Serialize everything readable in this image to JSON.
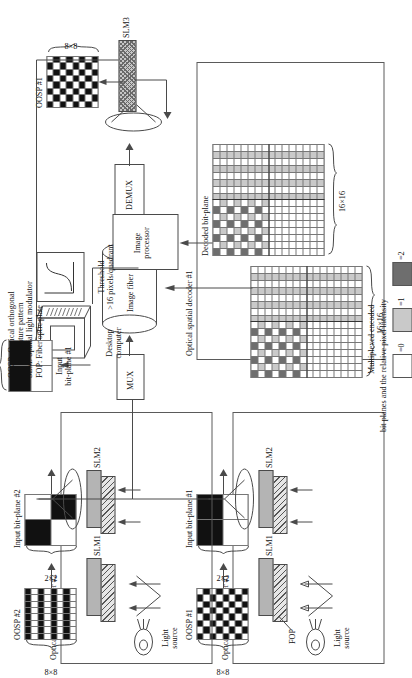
{
  "figure": {
    "orientation": "rotated-90-ccw"
  },
  "legend_intensity": {
    "title_line1": "Multiplexed encoded",
    "title_line2": "bit planes and the relative pixel intensity",
    "items": [
      {
        "label": "=0",
        "color": "#ffffff"
      },
      {
        "label": "=1",
        "color": "#c9c9c9"
      },
      {
        "label": "=2",
        "color": "#6e6e6e"
      }
    ]
  },
  "abbreviations": [
    "OOSP: Optical orthogonal",
    "signature pattern",
    "SLM: Spatial light modulator",
    "FOP: Fiber optic plate"
  ],
  "encoder1": {
    "frame_label": "Optical spatial encoder #1",
    "oosp_label": "OOSP #1",
    "oosp_size": "8×8",
    "bitplane_label": "Input bit-plane #1",
    "bitplane_size": "2×2",
    "slm1": "SLM1",
    "slm2": "SLM2",
    "fop": "FOP",
    "light_source_line1": "Light",
    "light_source_line2": "source"
  },
  "encoder2": {
    "frame_label": "Optical spatial encoder #2",
    "oosp_label": "OOSP #2",
    "oosp_size": "8×8",
    "bitplane_label": "Input bit-plane #2",
    "bitplane_size": "2×2",
    "slm1": "SLM1",
    "slm2": "SLM2",
    "light_source_line1": "Light",
    "light_source_line2": "source"
  },
  "channel": {
    "mux": "MUX",
    "fiber": "Image fiber",
    "demux": "DEMUX"
  },
  "decoder1": {
    "frame_label": "Optical spatial decoder #1",
    "decoded_label": "Decoded bit-plane",
    "decoded_size": "16×16",
    "slm3": "SLM3",
    "oosp_label": "OOSP #1",
    "oosp_size": "8×8",
    "image_processor_line1": "Image",
    "image_processor_line2": "processor",
    "threshold_line1": "Threshold",
    "threshold_line2": ">16 pixels/quadrant",
    "desktop_line1": "Desktop",
    "desktop_line2": "computer",
    "output_label_line1": "Input",
    "output_label_line2": "bit-plane #1",
    "output_size": "2×2"
  },
  "multiplexed_grid": {
    "size": "16×16",
    "description": "16x16 multiplexed encoded bit plane, upper-left quadrant carries the superposed checkerboard pattern"
  },
  "colors": {
    "line": "#4a4a4a",
    "black": "#111111",
    "gray_light": "#c9c9c9",
    "gray_dark": "#6e6e6e",
    "slab_gray": "#b4b4b4"
  }
}
